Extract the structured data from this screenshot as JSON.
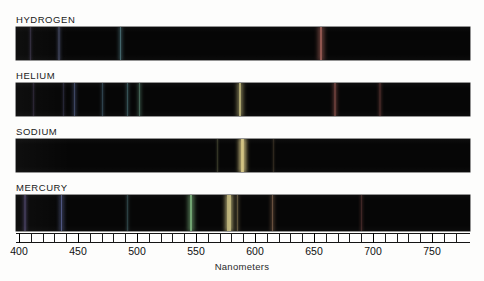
{
  "figure": {
    "axis_title": "Nanometers",
    "background_color": "#fdfdfc",
    "band_color": "#060606"
  },
  "axis": {
    "min": 400,
    "max": 775,
    "tick_interval": 10,
    "label_interval": 50,
    "labels": [
      "400",
      "450",
      "500",
      "550",
      "600",
      "650",
      "700",
      "750"
    ],
    "label_values": [
      400,
      450,
      500,
      550,
      600,
      650,
      700,
      750
    ],
    "unit": "nm"
  },
  "chart_data": {
    "type": "line",
    "xlabel": "Nanometers",
    "ylabel": "",
    "xlim": [
      400,
      775
    ],
    "grid": false,
    "legend": "none",
    "series": [
      {
        "name": "HYDROGEN",
        "lines": [
          {
            "wavelength": 410,
            "intensity": 0.25,
            "color": "#8f6fd0"
          },
          {
            "wavelength": 434,
            "intensity": 0.38,
            "color": "#6f7fd8"
          },
          {
            "wavelength": 486,
            "intensity": 0.55,
            "color": "#4fc3d8"
          },
          {
            "wavelength": 656,
            "intensity": 0.95,
            "color": "#d85a4a"
          }
        ]
      },
      {
        "name": "HELIUM",
        "lines": [
          {
            "wavelength": 412,
            "intensity": 0.18,
            "color": "#8a6ad0"
          },
          {
            "wavelength": 438,
            "intensity": 0.22,
            "color": "#7070d4"
          },
          {
            "wavelength": 447,
            "intensity": 0.55,
            "color": "#5f7ede"
          },
          {
            "wavelength": 471,
            "intensity": 0.35,
            "color": "#4fa8dc"
          },
          {
            "wavelength": 492,
            "intensity": 0.42,
            "color": "#49c0cf"
          },
          {
            "wavelength": 502,
            "intensity": 0.52,
            "color": "#5ccf9c"
          },
          {
            "wavelength": 587,
            "intensity": 0.92,
            "color": "#e0cf58"
          },
          {
            "wavelength": 668,
            "intensity": 0.6,
            "color": "#d8574a"
          },
          {
            "wavelength": 706,
            "intensity": 0.35,
            "color": "#c04a40"
          }
        ]
      },
      {
        "name": "SODIUM",
        "lines": [
          {
            "wavelength": 589.0,
            "intensity": 1.0,
            "color": "#f0d255"
          },
          {
            "wavelength": 589.6,
            "intensity": 0.95,
            "color": "#f0d255"
          },
          {
            "wavelength": 568,
            "intensity": 0.15,
            "color": "#cfd65e"
          },
          {
            "wavelength": 616,
            "intensity": 0.12,
            "color": "#dba050"
          }
        ]
      },
      {
        "name": "MERCURY",
        "lines": [
          {
            "wavelength": 405,
            "intensity": 0.45,
            "color": "#7a5fd0"
          },
          {
            "wavelength": 436,
            "intensity": 0.8,
            "color": "#5f73de"
          },
          {
            "wavelength": 492,
            "intensity": 0.28,
            "color": "#4ec2d2"
          },
          {
            "wavelength": 546,
            "intensity": 0.95,
            "color": "#63d265"
          },
          {
            "wavelength": 577,
            "intensity": 0.85,
            "color": "#e8d45a"
          },
          {
            "wavelength": 579,
            "intensity": 0.88,
            "color": "#ecd85c"
          },
          {
            "wavelength": 585,
            "intensity": 0.4,
            "color": "#e8b955"
          },
          {
            "wavelength": 615,
            "intensity": 0.55,
            "color": "#dd8a4c"
          },
          {
            "wavelength": 690,
            "intensity": 0.35,
            "color": "#c8504a"
          }
        ]
      }
    ]
  },
  "panels": [
    {
      "label": "HYDROGEN"
    },
    {
      "label": "HELIUM"
    },
    {
      "label": "SODIUM"
    },
    {
      "label": "MERCURY"
    }
  ]
}
